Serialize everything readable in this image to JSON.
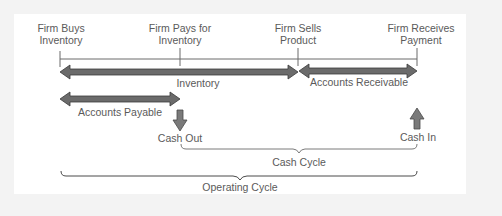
{
  "diagram": {
    "events": [
      {
        "line1": "Firm Buys",
        "line2": "Inventory"
      },
      {
        "line1": "Firm Pays for",
        "line2": "Inventory"
      },
      {
        "line1": "Firm Sells",
        "line2": "Product"
      },
      {
        "line1": "Firm Receives",
        "line2": "Payment"
      }
    ],
    "periods": {
      "inventory": "Inventory",
      "accounts_receivable": "Accounts Receivable",
      "accounts_payable": "Accounts Payable"
    },
    "cash_flows": {
      "cash_out": "Cash Out",
      "cash_in": "Cash In"
    },
    "cycles": {
      "cash_cycle": "Cash Cycle",
      "operating_cycle": "Operating Cycle"
    },
    "colors": {
      "arrow_fill": "#6b6b6b",
      "arrow_stroke": "#3a3a3a",
      "timeline": "#6a6a6a",
      "background": "#f3f3f3",
      "panel": "#ffffff"
    }
  }
}
